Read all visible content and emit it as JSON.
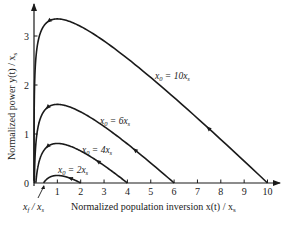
{
  "chart_data": {
    "type": "line",
    "title": "",
    "xlabel": "Normalized population inversion x(t) / x_s",
    "ylabel": "Normalized power y(t) / x_s",
    "xlim": [
      0,
      10.5
    ],
    "ylim": [
      0,
      3.6
    ],
    "x_ticks": [
      "1",
      "2",
      "3",
      "4",
      "5",
      "6",
      "7",
      "8",
      "9",
      "10"
    ],
    "y_ticks": [
      "0",
      "1",
      "2",
      "3"
    ],
    "grid": false,
    "legend": "none (inline curve labels)",
    "annotations": [
      "x_f / x_s"
    ],
    "series": [
      {
        "name": "x0 = 2xs",
        "x0": 2,
        "peak_x": 1,
        "peak_y": 0.15,
        "x_end": 2,
        "x_f": 0.41
      },
      {
        "name": "x0 = 4xs",
        "x0": 4,
        "peak_x": 1,
        "peak_y": 0.81,
        "x_end": 4,
        "x_f": 0.08
      },
      {
        "name": "x0 = 6xs",
        "x0": 6,
        "peak_x": 1,
        "peak_y": 1.6,
        "x_end": 6,
        "x_f": 0.015
      },
      {
        "name": "x0 = 10xs",
        "x0": 10,
        "peak_x": 1,
        "peak_y": 3.35,
        "x_end": 10,
        "x_f": 0.0005
      }
    ]
  },
  "labels": {
    "y_axis": "Normalized power y(t) / x",
    "y_axis_sub": "s",
    "x_axis": "Normalized population inversion x(t) / x",
    "x_axis_sub": "s",
    "x_f": "x",
    "x_f_sub": "f",
    "x_f_mid": " / x",
    "x_f_sub2": "s",
    "zero": "0",
    "curves": [
      {
        "prefix": "x",
        "sub": "0",
        "eq": " = 2x",
        "sub2": "s"
      },
      {
        "prefix": "x",
        "sub": "0",
        "eq": " = 4x",
        "sub2": "s"
      },
      {
        "prefix": "x",
        "sub": "0",
        "eq": " = 6x",
        "sub2": "s"
      },
      {
        "prefix": "x",
        "sub": "0",
        "eq": " = 10x",
        "sub2": "s"
      }
    ]
  }
}
